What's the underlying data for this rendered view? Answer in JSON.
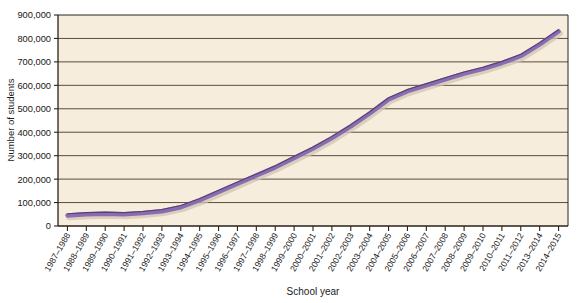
{
  "chart_data": {
    "type": "line",
    "title": "",
    "xlabel": "School year",
    "ylabel": "Number of students",
    "categories": [
      "1987–1988",
      "1988–1989",
      "1989–1990",
      "1990–1991",
      "1991–1992",
      "1992–1993",
      "1993–1994",
      "1994–1995",
      "1995–1996",
      "1996–1997",
      "1997–1998",
      "1998–1999",
      "1999–2000",
      "2000–2001",
      "2001–2002",
      "2002–2003",
      "2003–2004",
      "2004–2005",
      "2005–2006",
      "2006–2007",
      "2007–2008",
      "2008–2009",
      "2009–2010",
      "2010–2011",
      "2011–2012",
      "2013–2014",
      "2014–2015"
    ],
    "values": [
      45000,
      50000,
      52000,
      50000,
      55000,
      63000,
      80000,
      110000,
      145000,
      180000,
      215000,
      250000,
      290000,
      330000,
      375000,
      425000,
      480000,
      540000,
      575000,
      600000,
      625000,
      650000,
      670000,
      695000,
      725000,
      775000,
      830000
    ],
    "ylim": [
      0,
      900000
    ],
    "yticks": [
      0,
      100000,
      200000,
      300000,
      400000,
      500000,
      600000,
      700000,
      800000,
      900000
    ],
    "ytick_labels": [
      "0",
      "100,000",
      "200,000",
      "300,000",
      "400,000",
      "500,000",
      "600,000",
      "700,000",
      "800,000",
      "900,000"
    ],
    "grid": true,
    "legend": null,
    "series_color": "#8b6cb2",
    "series_outline_color": "#4a3a63",
    "plot_background": "#f6eddc",
    "gridline_color": "#4a3b2a",
    "axis_color": "#2b2218",
    "page_background": "#ffffff"
  }
}
